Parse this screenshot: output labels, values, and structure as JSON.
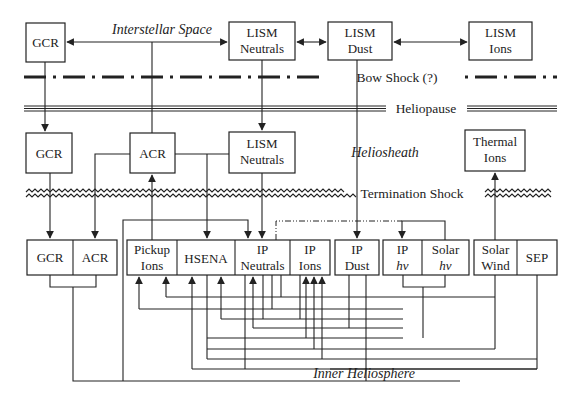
{
  "regions": {
    "interstellar": "Interstellar Space",
    "heliosheath": "Heliosheath",
    "inner": "Inner Heliosphere"
  },
  "boundaries": {
    "bow_shock": "Bow Shock (?)",
    "heliopause": "Heliopause",
    "termination_shock": "Termination Shock"
  },
  "interstellar_boxes": {
    "gcr": {
      "l1": "GCR"
    },
    "lism_neutrals": {
      "l1": "LISM",
      "l2": "Neutrals"
    },
    "lism_dust": {
      "l1": "LISM",
      "l2": "Dust"
    },
    "lism_ions": {
      "l1": "LISM",
      "l2": "Ions"
    }
  },
  "heliosheath_boxes": {
    "gcr": {
      "l1": "GCR"
    },
    "acr": {
      "l1": "ACR"
    },
    "lism_neutrals": {
      "l1": "LISM",
      "l2": "Neutrals"
    },
    "thermal_ions": {
      "l1": "Thermal",
      "l2": "Ions"
    }
  },
  "inner_boxes": {
    "gcr": {
      "l1": "GCR"
    },
    "acr": {
      "l1": "ACR"
    },
    "pickup_ions": {
      "l1": "Pickup",
      "l2": "Ions"
    },
    "hsena": {
      "l1": "HSENA"
    },
    "ip_neutrals": {
      "l1": "IP",
      "l2": "Neutrals"
    },
    "ip_ions": {
      "l1": "IP",
      "l2": "Ions"
    },
    "ip_dust": {
      "l1": "IP",
      "l2": "Dust"
    },
    "ip_hv": {
      "l1": "IP",
      "l2": "hν"
    },
    "solar_hv": {
      "l1": "Solar",
      "l2": "hν"
    },
    "solar_wind": {
      "l1": "Solar",
      "l2": "Wind"
    },
    "sep": {
      "l1": "SEP"
    }
  },
  "colors": {
    "line": "#222222",
    "background": "#ffffff"
  }
}
